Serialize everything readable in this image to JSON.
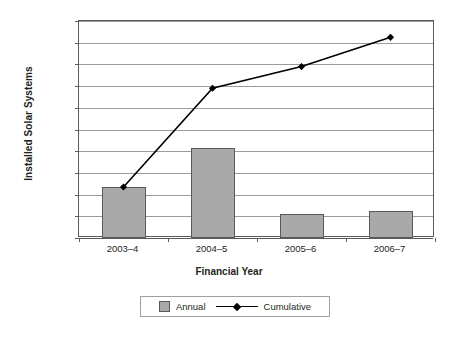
{
  "chart_data": {
    "type": "bar",
    "title": "",
    "subtitle": "",
    "xlabel": "Financial Year",
    "ylabel": "Installed Solar Systems",
    "categories": [
      "2003–4",
      "2004–5",
      "2005–6",
      "2006–7"
    ],
    "ylim": [
      0,
      20000
    ],
    "ytick_step": 2000,
    "yticks": [
      0,
      2000,
      4000,
      6000,
      8000,
      10000,
      12000,
      14000,
      16000,
      18000,
      20000
    ],
    "ytick_labels": [
      "0",
      "2000",
      "4000",
      "6000",
      "8000",
      "10000",
      "12000",
      "14000",
      "16000",
      "18000",
      "20000"
    ],
    "grid": true,
    "grid_axis": "y",
    "legend_position": "bottom",
    "series": [
      {
        "name": "Annual",
        "type": "bar",
        "values": [
          4700,
          8250,
          2200,
          2500
        ],
        "color": "#a9a9a9",
        "edge_color": "#58595b"
      },
      {
        "name": "Cumulative",
        "type": "line",
        "values": [
          4700,
          13800,
          15800,
          18500
        ],
        "color": "#000000",
        "marker": "diamond"
      }
    ]
  },
  "legend": {
    "items": [
      {
        "label": "Annual",
        "marker": "square-swatch"
      },
      {
        "label": "Cumulative",
        "marker": "line-diamond"
      }
    ]
  },
  "colors": {
    "bar_fill": "#a9a9a9",
    "bar_edge": "#58595b",
    "line": "#000000",
    "gridline": "#9b9b9b",
    "axis": "#5a5a5a",
    "text": "#231f20",
    "background": "#ffffff"
  }
}
